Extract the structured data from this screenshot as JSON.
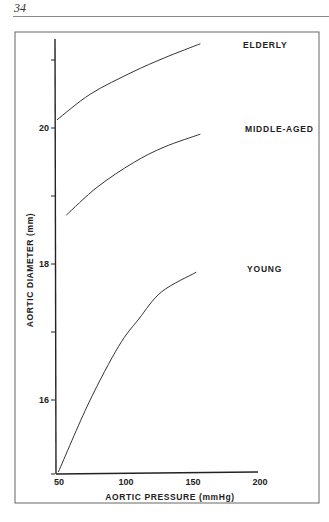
{
  "page": {
    "number": "34"
  },
  "chart_data": {
    "type": "line",
    "title": "",
    "xlabel": "AORTIC PRESSURE (mmHg)",
    "ylabel": "AORTIC DIAMETER (mm)",
    "xlim": [
      50,
      200
    ],
    "ylim": [
      15,
      21.4
    ],
    "x_ticks": [
      50,
      100,
      150,
      200
    ],
    "x_tick_labels": [
      "50",
      "100",
      "150",
      "200"
    ],
    "y_ticks": [
      15,
      16,
      17,
      18,
      19,
      20,
      21
    ],
    "y_tick_labels": [
      "",
      "16",
      "",
      "18",
      "",
      "20",
      ""
    ],
    "grid": false,
    "legend": "inline labels at right",
    "series": [
      {
        "name": "ELDERLY",
        "x": [
          50,
          75,
          106,
          130,
          157
        ],
        "y": [
          20.12,
          20.5,
          20.82,
          21.03,
          21.24
        ]
      },
      {
        "name": "MIDDLE-AGED",
        "x": [
          57,
          80,
          107,
          130,
          157
        ],
        "y": [
          18.72,
          19.13,
          19.49,
          19.72,
          19.91
        ]
      },
      {
        "name": "YOUNG",
        "x": [
          51,
          74,
          96,
          111,
          128,
          154
        ],
        "y": [
          14.94,
          15.97,
          16.79,
          17.19,
          17.59,
          17.88
        ]
      }
    ]
  }
}
